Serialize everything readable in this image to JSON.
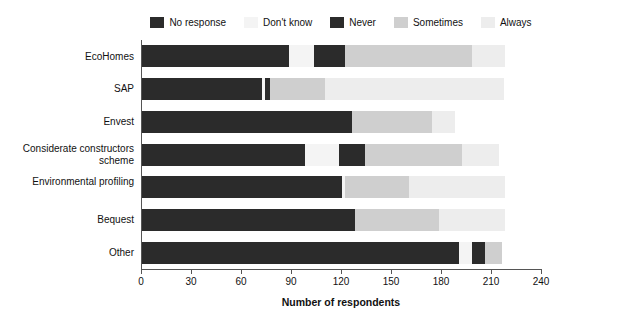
{
  "chart_data": {
    "type": "bar",
    "orientation": "horizontal",
    "stacked": true,
    "title": "",
    "xlabel": "Number of respondents",
    "ylabel": "",
    "xlim": [
      0,
      240
    ],
    "xticks": [
      0,
      30,
      60,
      90,
      120,
      150,
      180,
      210,
      240
    ],
    "grid": false,
    "legend_position": "top",
    "categories": [
      "EcoHomes",
      "SAP",
      "Envest",
      "Considerate constructors scheme",
      "Environmental profiling",
      "Bequest",
      "Other"
    ],
    "series": [
      {
        "name": "No response",
        "color": "#2b2b2b",
        "values": [
          88,
          72,
          126,
          98,
          120,
          128,
          190
        ]
      },
      {
        "name": "Don't know",
        "color": "#f4f4f4",
        "values": [
          15,
          2,
          0,
          20,
          2,
          0,
          8
        ]
      },
      {
        "name": "Never",
        "color": "#2b2b2b",
        "values": [
          19,
          3,
          0,
          16,
          0,
          0,
          8
        ]
      },
      {
        "name": "Sometimes",
        "color": "#cfcfcf",
        "values": [
          76,
          33,
          48,
          58,
          38,
          50,
          10
        ]
      },
      {
        "name": "Always",
        "color": "#ededed",
        "values": [
          20,
          107,
          14,
          22,
          58,
          40,
          0
        ]
      }
    ]
  },
  "legend": {
    "items": [
      {
        "label": "No response",
        "color": "#2b2b2b"
      },
      {
        "label": "Don't know",
        "color": "#f4f4f4"
      },
      {
        "label": "Never",
        "color": "#2b2b2b"
      },
      {
        "label": "Sometimes",
        "color": "#cfcfcf"
      },
      {
        "label": "Always",
        "color": "#ededed"
      }
    ]
  },
  "axis": {
    "x_title": "Number of respondents",
    "x_tick_labels": [
      "0",
      "30",
      "60",
      "90",
      "120",
      "150",
      "180",
      "210",
      "240"
    ],
    "y_tick_labels": [
      "EcoHomes",
      "SAP",
      "Envest",
      "Considerate constructors scheme",
      "Environmental profiling",
      "Bequest",
      "Other"
    ]
  }
}
